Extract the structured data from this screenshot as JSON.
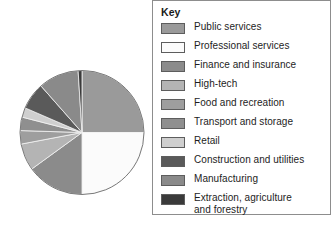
{
  "legend": {
    "title": "Key",
    "border_color": "#8d8d8d",
    "items": [
      {
        "label": "Public services",
        "color": "#9a9a9a"
      },
      {
        "label": "Professional services",
        "color": "#fbfbfb"
      },
      {
        "label": "Finance and insurance",
        "color": "#8b8b8b"
      },
      {
        "label": "High-tech",
        "color": "#b4b4b4"
      },
      {
        "label": "Food and recreation",
        "color": "#9e9e9e"
      },
      {
        "label": "Transport and storage",
        "color": "#8f8f8f"
      },
      {
        "label": "Retail",
        "color": "#cfcfcf"
      },
      {
        "label": "Construction and utilities",
        "color": "#5a5a5a"
      },
      {
        "label": "Manufacturing",
        "color": "#8a8a8a"
      },
      {
        "label": "Extraction, agriculture\nand forestry",
        "color": "#3a3a3a"
      }
    ]
  },
  "chart_data": {
    "type": "pie",
    "title": "",
    "start_angle_deg": 0,
    "direction": "clockwise",
    "outline_color": "#7a7a7a",
    "categories": [
      "Public services",
      "Professional services",
      "Finance and insurance",
      "High-tech",
      "Food and recreation",
      "Transport and storage",
      "Retail",
      "Construction and utilities",
      "Manufacturing",
      "Extraction, agriculture and forestry"
    ],
    "values": [
      25,
      25,
      15,
      7,
      3.5,
      3.5,
      2.5,
      7,
      10.5,
      1
    ],
    "units": "percent",
    "colors": [
      "#9a9a9a",
      "#fbfbfb",
      "#8b8b8b",
      "#b4b4b4",
      "#9e9e9e",
      "#8f8f8f",
      "#cfcfcf",
      "#5a5a5a",
      "#8a8a8a",
      "#3a3a3a"
    ],
    "legend_position": "right",
    "grid": false,
    "xlabel": "",
    "ylabel": ""
  }
}
